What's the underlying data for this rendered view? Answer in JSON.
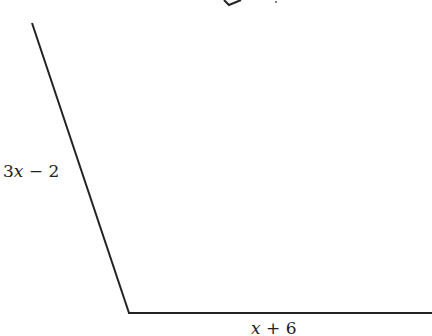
{
  "diagram": {
    "type": "geometry-figure",
    "sides": [
      {
        "id": "left-slanted-side",
        "label": "3x − 2",
        "from": [
          32,
          23
        ],
        "to": [
          129,
          313
        ]
      },
      {
        "id": "bottom-side",
        "label": "x + 6",
        "from": [
          129,
          313
        ],
        "to": [
          432,
          313
        ]
      }
    ],
    "stroke_color": "#222222",
    "background": "#ffffff"
  },
  "labels": {
    "left_side": "3x − 2",
    "bottom_side": "x + 6"
  }
}
